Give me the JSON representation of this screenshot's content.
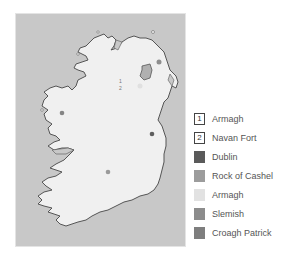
{
  "map": {
    "title": "",
    "sea_color": "#c8c8c8",
    "land_color": "#f0f0f0",
    "coast_color": "#555555",
    "markers": [
      {
        "id": "1",
        "kind": "numbered",
        "label": "1",
        "x": 118,
        "y": 66
      },
      {
        "id": "2",
        "kind": "numbered",
        "label": "2",
        "x": 118,
        "y": 73
      },
      {
        "id": "slemish",
        "kind": "dot",
        "x": 143,
        "y": 48,
        "color": "#8e8e8e"
      },
      {
        "id": "croagh-patrick",
        "kind": "dot",
        "x": 46,
        "y": 99,
        "color": "#858585"
      },
      {
        "id": "dublin",
        "kind": "dot",
        "x": 136,
        "y": 120,
        "color": "#5e5e5e"
      },
      {
        "id": "rock-of-cashel",
        "kind": "dot",
        "x": 92,
        "y": 158,
        "color": "#9a9a9a"
      },
      {
        "id": "armagh-area",
        "kind": "dot",
        "x": 124,
        "y": 72,
        "color": "#e0e0e0"
      }
    ]
  },
  "legend": {
    "items": [
      {
        "symbol": "1",
        "label": "Armagh",
        "style": "boxed-number",
        "color": "#ffffff"
      },
      {
        "symbol": "2",
        "label": "Navan Fort",
        "style": "boxed-number",
        "color": "#ffffff"
      },
      {
        "symbol": "",
        "label": "Dublin",
        "style": "swatch",
        "color": "#5a5a5a"
      },
      {
        "symbol": "",
        "label": "Rock of Cashel",
        "style": "swatch",
        "color": "#9c9c9c"
      },
      {
        "symbol": "",
        "label": "Armagh",
        "style": "swatch",
        "color": "#e2e2e2"
      },
      {
        "symbol": "",
        "label": "Slemish",
        "style": "swatch",
        "color": "#8c8c8c"
      },
      {
        "symbol": "",
        "label": "Croagh Patrick",
        "style": "swatch",
        "color": "#7e7e7e"
      }
    ]
  }
}
